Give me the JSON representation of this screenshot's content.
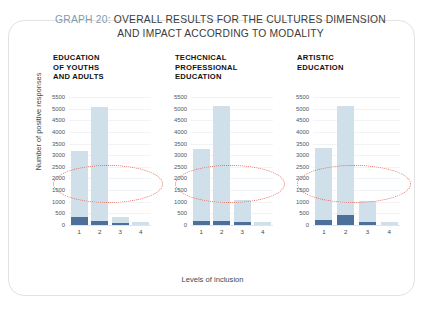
{
  "figure": {
    "title_prefix": "GRAPH 20:",
    "title_line1_rest": " OVERALL RESULTS FOR THE CULTURES DIMENSION",
    "title_line2": "AND IMPACT ACCORDING TO MODALITY",
    "ylabel": "Number of positive responses",
    "xlabel": "Levels of inclusion"
  },
  "colors": {
    "bar_light": "#cfe0ea",
    "bar_dark": "#4c6f9c",
    "annotation_red": "#e06a5a",
    "title_accent": "#7d9cb3",
    "text": "#3d4a52"
  },
  "annotations": [
    {
      "type": "dotted-ellipse",
      "target": "x-axis-levels",
      "color": "#e06a5a"
    },
    {
      "type": "dotted-ellipse",
      "target": "x-axis-levels",
      "color": "#e06a5a"
    },
    {
      "type": "dotted-ellipse",
      "target": "x-axis-levels",
      "color": "#e06a5a"
    }
  ],
  "chart_data": {
    "type": "bar",
    "title": "GRAPH 20: OVERALL RESULTS FOR THE CULTURES DIMENSION AND IMPACT ACCORDING TO MODALITY",
    "xlabel": "Levels of inclusion",
    "ylabel": "Number of positive responses",
    "categories": [
      "1",
      "2",
      "3",
      "4"
    ],
    "ylim": [
      0,
      5500
    ],
    "yticks": [
      0,
      500,
      1000,
      1500,
      2000,
      2500,
      3000,
      3500,
      4000,
      4500,
      5000,
      5500
    ],
    "ytick_labels": [
      "0",
      "500",
      "1000",
      "1500",
      "2000",
      "2500",
      "3000",
      "3500",
      "4000",
      "4500",
      "5000",
      "5500"
    ],
    "grid": true,
    "legend": "none",
    "panels": [
      {
        "title_lines": [
          "EDUCATION",
          "OF YOUTHS",
          "AND ADULTS"
        ],
        "values": [
          3200,
          5050,
          330,
          120
        ],
        "base_values": [
          330,
          180,
          60,
          0
        ]
      },
      {
        "title_lines": [
          "TECHCNICAL",
          "PROFESSIONAL",
          "EDUCATION"
        ],
        "values": [
          3250,
          5100,
          1080,
          150
        ],
        "base_values": [
          190,
          170,
          110,
          0
        ]
      },
      {
        "title_lines": [
          "ARTISTIC",
          "EDUCATION"
        ],
        "values": [
          3300,
          5100,
          1050,
          130
        ],
        "base_values": [
          220,
          430,
          130,
          0
        ]
      }
    ]
  }
}
